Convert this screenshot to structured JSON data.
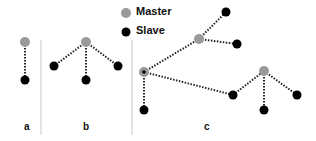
{
  "legend": {
    "master_label": "Master",
    "slave_label": "Slave"
  },
  "panels": [
    {
      "label": "a"
    },
    {
      "label": "b"
    },
    {
      "label": "c"
    }
  ],
  "colors": {
    "master": "#9a9a9a",
    "slave": "#000000",
    "link": "#222222",
    "divider": "#c8c8c8"
  }
}
